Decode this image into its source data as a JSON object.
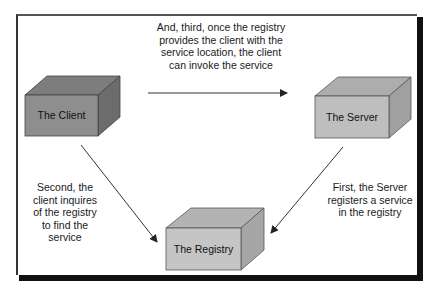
{
  "diagram": {
    "colors": {
      "background": "#ffffff",
      "frame": "#222222",
      "client_front": "#8c8c8c",
      "client_top": "#7a7a7a",
      "client_side": "#6e6e6e",
      "server_front": "#bdbdbd",
      "server_top": "#adadad",
      "server_side": "#a0a0a0",
      "registry_front": "#c4c4c4",
      "registry_top": "#b3b3b3",
      "registry_side": "#a6a6a6",
      "edge": "#444444",
      "arrow": "#333333"
    },
    "nodes": [
      {
        "id": "client",
        "label": "The Client"
      },
      {
        "id": "server",
        "label": "The Server"
      },
      {
        "id": "registry",
        "label": "The Registry"
      }
    ],
    "edges": [
      {
        "id": "invoke",
        "from": "client",
        "to": "server",
        "order": "third"
      },
      {
        "id": "inquire",
        "from": "client",
        "to": "registry",
        "order": "second"
      },
      {
        "id": "register",
        "from": "server",
        "to": "registry",
        "order": "first"
      }
    ],
    "captions": {
      "top": "And, third, once the registry\nprovides the client with the\nservice location, the client\ncan invoke the service",
      "left": "Second, the\nclient inquires\nof the registry\nto find the\nservice",
      "right": "First, the Server\nregisters a service\nin the registry"
    }
  }
}
